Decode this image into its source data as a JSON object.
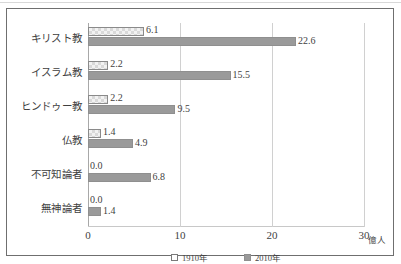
{
  "chart_data": {
    "type": "bar",
    "orientation": "horizontal",
    "title": "",
    "xlabel": "億人",
    "ylabel": "",
    "xlim": [
      0,
      30
    ],
    "xticks": [
      "0",
      "10",
      "20",
      "30"
    ],
    "grid": true,
    "legend_position": "bottom",
    "categories": [
      "キリスト教",
      "イスラム教",
      "ヒンドゥー教",
      "仏教",
      "不可知論者",
      "無神論者"
    ],
    "series": [
      {
        "name": "1910年",
        "values": [
          6.1,
          2.2,
          2.2,
          1.4,
          0.0,
          0.0
        ],
        "labels": [
          "6.1",
          "2.2",
          "2.2",
          "1.4",
          "0.0",
          "0.0"
        ],
        "color": "#f2f2f2",
        "pattern": "checker"
      },
      {
        "name": "2010年",
        "values": [
          22.6,
          15.5,
          9.5,
          4.9,
          6.8,
          1.4
        ],
        "labels": [
          "22.6",
          "15.5",
          "9.5",
          "4.9",
          "6.8",
          "1.4"
        ],
        "color": "#9a9a9a",
        "pattern": "solid"
      }
    ]
  },
  "legend": {
    "items": [
      {
        "label": "1910年",
        "swatch": "legend-swatch-1910"
      },
      {
        "label": "2010年",
        "swatch": "legend-swatch-2010"
      }
    ]
  },
  "axis": {
    "unit_label": "億人"
  }
}
